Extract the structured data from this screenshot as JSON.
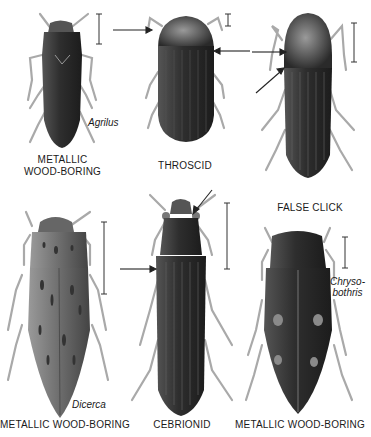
{
  "plate": {
    "specimens": [
      {
        "id": "agrilus",
        "common_name_line1": "METALLIC",
        "common_name_line2": "WOOD-BORING",
        "genus": "Agrilus"
      },
      {
        "id": "throscid",
        "common_name_line1": "THROSCID"
      },
      {
        "id": "false-click",
        "common_name_line1": "FALSE CLICK"
      },
      {
        "id": "dicerca",
        "common_name_line1": "METALLIC WOOD-BORING",
        "genus": "Dicerca"
      },
      {
        "id": "cebrionid",
        "common_name_line1": "CEBRIONID"
      },
      {
        "id": "chrysobothris",
        "common_name_line1": "METALLIC WOOD-BORING",
        "genus_line1": "Chryso-",
        "genus_line2": "bothris"
      }
    ]
  },
  "colors": {
    "ink": "#1a1a1a",
    "body_dark": "#3a3a3a",
    "body_mid": "#6a6a6a",
    "leg": "#bdbdbd",
    "background": "#ffffff"
  }
}
